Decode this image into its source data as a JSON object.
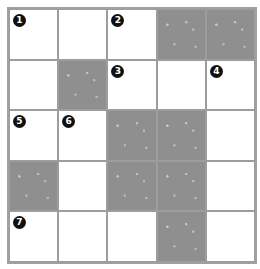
{
  "puzzle": {
    "rows": 5,
    "cols": 5,
    "colors": {
      "block": "#8f8f8f",
      "white": "#ffffff",
      "line": "#9d9d9d",
      "number_badge": "#111111"
    },
    "cells": [
      [
        {
          "b": false,
          "n": "1"
        },
        {
          "b": false,
          "n": ""
        },
        {
          "b": false,
          "n": "2"
        },
        {
          "b": true,
          "n": ""
        },
        {
          "b": true,
          "n": ""
        }
      ],
      [
        {
          "b": false,
          "n": ""
        },
        {
          "b": true,
          "n": ""
        },
        {
          "b": false,
          "n": "3"
        },
        {
          "b": false,
          "n": ""
        },
        {
          "b": false,
          "n": "4"
        }
      ],
      [
        {
          "b": false,
          "n": "5"
        },
        {
          "b": false,
          "n": "6"
        },
        {
          "b": true,
          "n": ""
        },
        {
          "b": true,
          "n": ""
        },
        {
          "b": false,
          "n": ""
        }
      ],
      [
        {
          "b": true,
          "n": ""
        },
        {
          "b": false,
          "n": ""
        },
        {
          "b": true,
          "n": ""
        },
        {
          "b": true,
          "n": ""
        },
        {
          "b": false,
          "n": ""
        }
      ],
      [
        {
          "b": false,
          "n": "7"
        },
        {
          "b": false,
          "n": ""
        },
        {
          "b": false,
          "n": ""
        },
        {
          "b": true,
          "n": ""
        },
        {
          "b": false,
          "n": ""
        }
      ]
    ]
  }
}
